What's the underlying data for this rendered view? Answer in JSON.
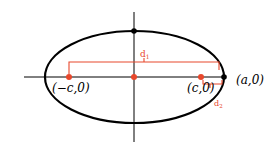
{
  "diagram": {
    "colors": {
      "curve": "#000000",
      "accent": "#e8482c"
    },
    "labels": {
      "left_focus": "(−c,0)",
      "right_focus": "(c,0)",
      "vertex": "(a,0)",
      "d1": "d",
      "d1_sub": "1",
      "d2": "d",
      "d2_sub": "2"
    },
    "points": [
      {
        "name": "left-focus",
        "label": "(-c,0)",
        "color": "#e8482c"
      },
      {
        "name": "center",
        "label": "",
        "color": "#e8482c"
      },
      {
        "name": "right-focus",
        "label": "(c,0)",
        "color": "#e8482c"
      },
      {
        "name": "right-vertex",
        "label": "(a,0)",
        "color": "#000000"
      },
      {
        "name": "top-vertex",
        "label": "",
        "color": "#000000"
      }
    ]
  }
}
